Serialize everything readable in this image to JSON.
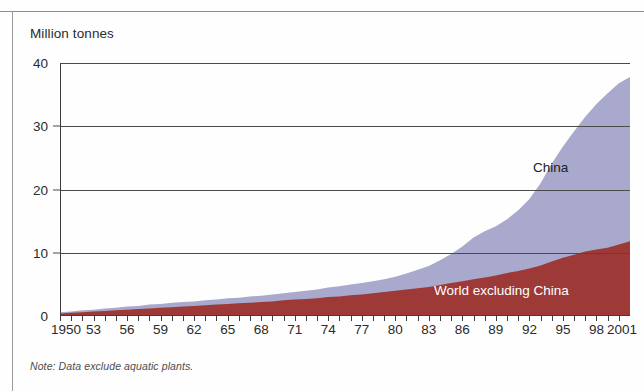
{
  "figure": {
    "y_axis_title": "Million tonnes",
    "note": "Note: Data exclude aquatic plants."
  },
  "labels": {
    "china": "China",
    "world_excluding_china": "World excluding China"
  },
  "colors": {
    "china_area": "#a9a8cd",
    "world_area": "#9d3a37",
    "gridline": "#4a4a4a",
    "axis": "#2b2b2b",
    "frame": "#8d8d8d"
  },
  "chart_data": {
    "type": "area",
    "stacked": true,
    "title": "",
    "subtitle": "",
    "xlabel": "",
    "ylabel": "Million tonnes",
    "ylim": [
      0,
      40
    ],
    "xlim": [
      1950,
      2001
    ],
    "yticks": [
      0,
      10,
      20,
      30,
      40
    ],
    "ytick_labels": [
      "0",
      "10",
      "20",
      "30",
      "40"
    ],
    "xticks": [
      1950,
      1953,
      1956,
      1959,
      1962,
      1965,
      1968,
      1971,
      1974,
      1977,
      1980,
      1983,
      1986,
      1989,
      1992,
      1995,
      1998,
      2001
    ],
    "xtick_labels": [
      "1950",
      "53",
      "56",
      "59",
      "62",
      "65",
      "68",
      "71",
      "74",
      "77",
      "80",
      "83",
      "86",
      "89",
      "92",
      "95",
      "98",
      "2001"
    ],
    "minor_xticks_every": 1,
    "grid": "horizontal",
    "legend_position": "inline-annotations",
    "annotations": [
      {
        "text": "China",
        "x": 1995,
        "y": 22
      },
      {
        "text": "World excluding China",
        "x": 1989,
        "y": 4
      }
    ],
    "x": [
      1950,
      1951,
      1952,
      1953,
      1954,
      1955,
      1956,
      1957,
      1958,
      1959,
      1960,
      1961,
      1962,
      1963,
      1964,
      1965,
      1966,
      1967,
      1968,
      1969,
      1970,
      1971,
      1972,
      1973,
      1974,
      1975,
      1976,
      1977,
      1978,
      1979,
      1980,
      1981,
      1982,
      1983,
      1984,
      1985,
      1986,
      1987,
      1988,
      1989,
      1990,
      1991,
      1992,
      1993,
      1994,
      1995,
      1996,
      1997,
      1998,
      1999,
      2000,
      2001
    ],
    "series": [
      {
        "name": "World excluding China",
        "color": "#9d3a37",
        "values": [
          0.4,
          0.5,
          0.6,
          0.7,
          0.8,
          0.9,
          1.0,
          1.1,
          1.2,
          1.3,
          1.4,
          1.5,
          1.6,
          1.7,
          1.8,
          1.9,
          2.0,
          2.1,
          2.2,
          2.3,
          2.5,
          2.6,
          2.7,
          2.8,
          3.0,
          3.1,
          3.3,
          3.4,
          3.6,
          3.8,
          4.0,
          4.2,
          4.4,
          4.6,
          4.9,
          5.2,
          5.5,
          5.8,
          6.1,
          6.4,
          6.8,
          7.1,
          7.5,
          8.0,
          8.6,
          9.2,
          9.7,
          10.2,
          10.5,
          10.8,
          11.3,
          11.8
        ]
      },
      {
        "name": "China",
        "color": "#a9a8cd",
        "values": [
          0.2,
          0.2,
          0.3,
          0.3,
          0.4,
          0.4,
          0.5,
          0.5,
          0.6,
          0.6,
          0.7,
          0.7,
          0.7,
          0.8,
          0.8,
          0.9,
          0.9,
          1.0,
          1.0,
          1.1,
          1.1,
          1.2,
          1.3,
          1.4,
          1.5,
          1.6,
          1.7,
          1.8,
          1.9,
          2.0,
          2.2,
          2.5,
          2.9,
          3.3,
          3.9,
          4.6,
          5.5,
          6.6,
          7.3,
          7.8,
          8.5,
          9.6,
          11.0,
          13.0,
          15.5,
          17.6,
          19.5,
          21.3,
          23.0,
          24.4,
          25.5,
          26.0
        ]
      }
    ],
    "total_values": [
      0.6,
      0.7,
      0.9,
      1.0,
      1.2,
      1.3,
      1.5,
      1.6,
      1.8,
      1.9,
      2.1,
      2.2,
      2.3,
      2.5,
      2.6,
      2.8,
      2.9,
      3.1,
      3.2,
      3.4,
      3.6,
      3.8,
      4.0,
      4.2,
      4.5,
      4.7,
      5.0,
      5.2,
      5.5,
      5.8,
      6.2,
      6.7,
      7.3,
      7.9,
      8.8,
      9.8,
      11.0,
      12.4,
      13.4,
      14.2,
      15.3,
      16.7,
      18.5,
      21.0,
      24.1,
      26.8,
      29.2,
      31.5,
      33.5,
      35.2,
      36.8,
      37.8
    ]
  }
}
